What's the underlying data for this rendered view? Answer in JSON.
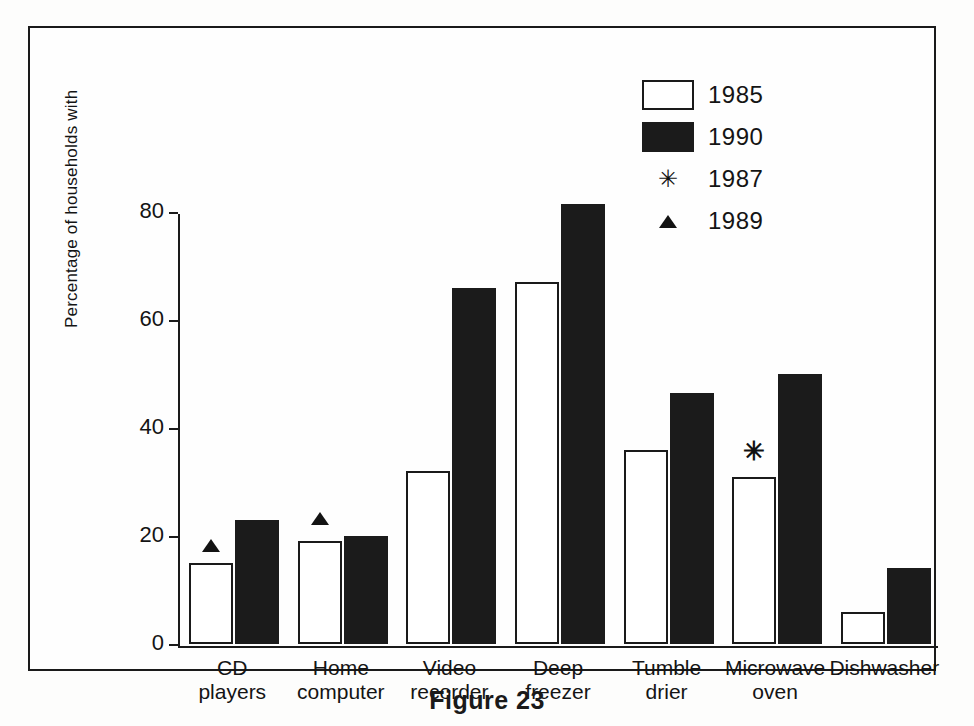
{
  "caption": "Figure 23",
  "legend": {
    "position": "top-right",
    "entries": [
      {
        "label": "1985",
        "symbol": "open-square",
        "color": "#ffffff"
      },
      {
        "label": "1990",
        "symbol": "filled-square",
        "color": "#1b1b1b"
      },
      {
        "label": "1987",
        "symbol": "asterisk",
        "glyph": "✳",
        "color": "#121212"
      },
      {
        "label": "1989",
        "symbol": "filled-triangle",
        "color": "#131313"
      }
    ]
  },
  "axes": {
    "ylabel": "Percentage of households with",
    "yticks": [
      "0",
      "20",
      "40",
      "60",
      "80"
    ],
    "xlabel": ""
  },
  "chart_data": {
    "type": "bar",
    "title": "",
    "xlabel": "",
    "ylabel": "Percentage of households with",
    "ylim": [
      0,
      85
    ],
    "yticks": [
      0,
      20,
      40,
      60,
      80
    ],
    "grid": false,
    "legend_position": "top-right",
    "categories": [
      "CD\nplayers",
      "Home\ncomputer",
      "Video\nrecorder",
      "Deep\nfreezer",
      "Tumble\ndrier",
      "Microwave\noven",
      "Dishwasher"
    ],
    "series": [
      {
        "name": "1985",
        "style": "open-bar",
        "values": [
          15,
          19,
          32,
          67,
          36,
          31,
          6
        ]
      },
      {
        "name": "1990",
        "style": "filled-bar",
        "values": [
          23,
          20,
          66,
          81.5,
          46.5,
          50,
          14
        ]
      }
    ],
    "annotations": [
      {
        "marker": "1989",
        "symbol": "filled-triangle",
        "category": "CD\nplayers",
        "series": "1985",
        "value": 17
      },
      {
        "marker": "1989",
        "symbol": "filled-triangle",
        "category": "Home\ncomputer",
        "series": "1985",
        "value": 22
      },
      {
        "marker": "1987",
        "symbol": "asterisk",
        "category": "Microwave\noven",
        "series": "1985",
        "value": 34
      }
    ]
  }
}
